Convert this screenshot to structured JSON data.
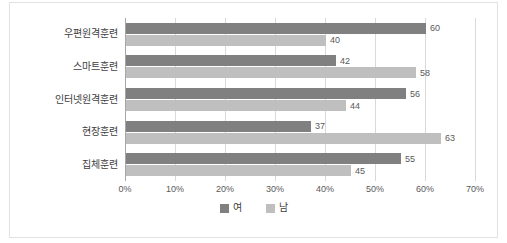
{
  "chart_data": {
    "type": "bar",
    "orientation": "horizontal",
    "title": "",
    "xlabel": "",
    "ylabel": "",
    "xlim": [
      0,
      70
    ],
    "xticks": [
      "0%",
      "10%",
      "20%",
      "30%",
      "40%",
      "50%",
      "60%",
      "70%"
    ],
    "xtick_values": [
      0,
      10,
      20,
      30,
      40,
      50,
      60,
      70
    ],
    "grid": true,
    "legend_position": "bottom",
    "categories": [
      "우편원격훈련",
      "스마트훈련",
      "인터넷원격훈련",
      "현장훈련",
      "집체훈련"
    ],
    "series": [
      {
        "name": "여",
        "color": "#808080",
        "values": [
          60,
          42,
          56,
          37,
          55
        ]
      },
      {
        "name": "남",
        "color": "#bfbfbf",
        "values": [
          40,
          58,
          44,
          63,
          45
        ]
      }
    ]
  },
  "clipped_title": "",
  "legend": {
    "items": [
      {
        "label": "여",
        "color": "#808080"
      },
      {
        "label": "남",
        "color": "#bfbfbf"
      }
    ]
  },
  "colors": {
    "female_bar": "#808080",
    "male_bar": "#bfbfbf",
    "gridline": "#d9d9d9",
    "axis": "#a6a6a6",
    "frame_border": "#e2e2e2",
    "label_text": "#404040",
    "value_text": "#595959",
    "background": "#ffffff"
  }
}
